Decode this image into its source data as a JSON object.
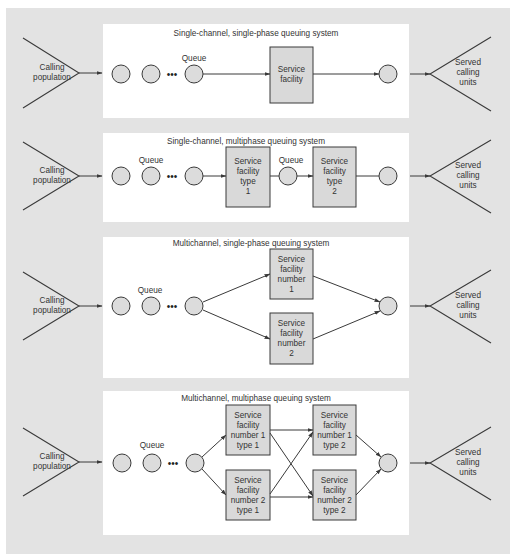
{
  "diagram": {
    "colors": {
      "background": "#e3e3e3",
      "panel": "#ffffff",
      "box_fill": "#d9d9d9",
      "circle_fill": "#dcdcdc",
      "stroke": "#3a3a3a"
    },
    "panels": [
      {
        "title": "Single-channel, single-phase queuing system",
        "source": [
          "Calling",
          "population"
        ],
        "sink": [
          "Served",
          "calling",
          "units"
        ],
        "queue_label": "Queue",
        "ellipsis": "•••",
        "boxes": [
          {
            "lines": [
              "Service",
              "facility"
            ]
          }
        ]
      },
      {
        "title": "Single-channel, multiphase queuing system",
        "source": [
          "Calling",
          "population"
        ],
        "sink": [
          "Served",
          "calling",
          "units"
        ],
        "queue_label": "Queue",
        "mid_queue_label": "Queue",
        "ellipsis": "•••",
        "boxes": [
          {
            "lines": [
              "Service",
              "facility",
              "type",
              "1"
            ]
          },
          {
            "lines": [
              "Service",
              "facility",
              "type",
              "2"
            ]
          }
        ]
      },
      {
        "title": "Multichannel, single-phase queuing system",
        "source": [
          "Calling",
          "population"
        ],
        "sink": [
          "Served",
          "calling",
          "units"
        ],
        "queue_label": "Queue",
        "ellipsis": "•••",
        "boxes": [
          {
            "lines": [
              "Service",
              "facility",
              "number",
              "1"
            ]
          },
          {
            "lines": [
              "Service",
              "facility",
              "number",
              "2"
            ]
          }
        ]
      },
      {
        "title": "Multichannel, multiphase queuing system",
        "source": [
          "Calling",
          "population"
        ],
        "sink": [
          "Served",
          "calling",
          "units"
        ],
        "queue_label": "Queue",
        "ellipsis": "•••",
        "boxes": [
          {
            "lines": [
              "Service",
              "facility",
              "number 1",
              "type 1"
            ]
          },
          {
            "lines": [
              "Service",
              "facility",
              "number 2",
              "type 1"
            ]
          },
          {
            "lines": [
              "Service",
              "facility",
              "number 1",
              "type 2"
            ]
          },
          {
            "lines": [
              "Service",
              "facility",
              "number 2",
              "type 2"
            ]
          }
        ]
      }
    ]
  }
}
